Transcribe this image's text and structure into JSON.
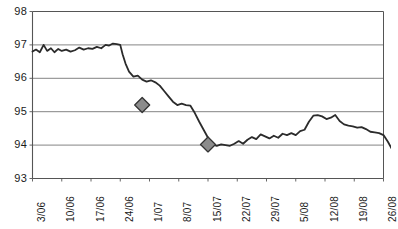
{
  "chart_data": {
    "type": "line",
    "title": "",
    "subtitle": "",
    "xlabel": "",
    "ylabel": "",
    "ylim": [
      93,
      98
    ],
    "yticks": [
      93,
      94,
      95,
      96,
      97,
      98
    ],
    "ytick_labels": [
      "93",
      "94",
      "95",
      "96",
      "97",
      "98"
    ],
    "grid": true,
    "grid_axis": "y",
    "legend": false,
    "legend_position": "none",
    "categories": [
      "3/06",
      "10/06",
      "17/06",
      "24/06",
      "1/07",
      "8/07",
      "15/07",
      "22/07",
      "29/07",
      "5/08",
      "12/08",
      "19/08",
      "26/08"
    ],
    "xtick_labels": [
      "3/06",
      "10/06",
      "17/06",
      "24/06",
      "1/07",
      "8/07",
      "15/07",
      "22/07",
      "29/07",
      "5/08",
      "12/08",
      "19/08",
      "26/08"
    ],
    "xtick_rotation": -90,
    "line_color": "#2b2b2b",
    "line_width": 1.8,
    "marker_color": "#8c8c8c",
    "marker_edge_color": "#333333",
    "marker_shape": "diamond",
    "axis_color": "#555555",
    "grid_color": "#777777",
    "background": "#ffffff",
    "series": [
      {
        "name": "value",
        "x": [
          0.0,
          0.12,
          0.25,
          0.38,
          0.5,
          0.63,
          0.75,
          0.88,
          1.0,
          1.15,
          1.3,
          1.45,
          1.6,
          1.75,
          1.9,
          2.05,
          2.2,
          2.35,
          2.5,
          2.62,
          2.75,
          2.88,
          3.0,
          3.08,
          3.18,
          3.3,
          3.45,
          3.6,
          3.75,
          3.9,
          4.05,
          4.2,
          4.35,
          4.5,
          4.65,
          4.8,
          4.95,
          5.1,
          5.25,
          5.4,
          5.55,
          5.7,
          5.85,
          6.0,
          6.15,
          6.3,
          6.45,
          6.6,
          6.75,
          6.9,
          7.05,
          7.2,
          7.35,
          7.5,
          7.65,
          7.8,
          7.95,
          8.1,
          8.25,
          8.4,
          8.55,
          8.7,
          8.85,
          9.0,
          9.15,
          9.3,
          9.45,
          9.6,
          9.75,
          9.9,
          10.05,
          10.2,
          10.35,
          10.5,
          10.65,
          10.8,
          10.95,
          11.1,
          11.25,
          11.4,
          11.55,
          11.7,
          11.85,
          12.0,
          12.15,
          12.3,
          12.45
        ],
        "values": [
          96.8,
          96.86,
          96.78,
          97.0,
          96.82,
          96.9,
          96.78,
          96.88,
          96.82,
          96.86,
          96.8,
          96.84,
          96.92,
          96.86,
          96.9,
          96.88,
          96.94,
          96.9,
          97.0,
          96.98,
          97.04,
          97.02,
          97.0,
          96.72,
          96.44,
          96.2,
          96.05,
          96.08,
          95.96,
          95.9,
          95.94,
          95.88,
          95.78,
          95.62,
          95.46,
          95.3,
          95.2,
          95.24,
          95.2,
          95.18,
          94.96,
          94.7,
          94.46,
          94.22,
          94.02,
          93.98,
          94.02,
          94.0,
          93.98,
          94.04,
          94.12,
          94.04,
          94.16,
          94.24,
          94.18,
          94.32,
          94.26,
          94.2,
          94.28,
          94.22,
          94.34,
          94.3,
          94.36,
          94.3,
          94.42,
          94.46,
          94.7,
          94.88,
          94.9,
          94.86,
          94.78,
          94.82,
          94.9,
          94.72,
          94.62,
          94.58,
          94.56,
          94.52,
          94.54,
          94.48,
          94.4,
          94.38,
          94.36,
          94.3,
          94.1,
          93.86,
          93.82
        ]
      }
    ],
    "markers": [
      {
        "x": 3.75,
        "y": 95.2,
        "label": "95.2"
      },
      {
        "x": 6.0,
        "y": 94.02,
        "label": "94.0"
      }
    ]
  }
}
